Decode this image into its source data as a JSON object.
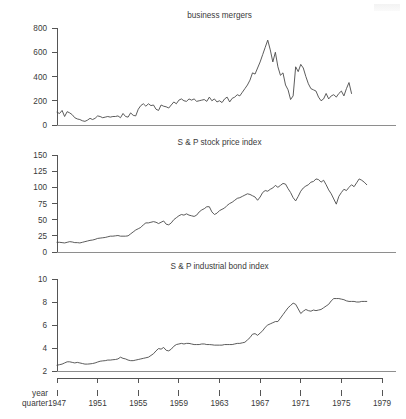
{
  "figure": {
    "width": 406,
    "height": 419,
    "background": "#ffffff",
    "line_color": "#4a4a4a",
    "axis_color": "#555555",
    "text_color": "#3a3a3a"
  },
  "axis_names": {
    "year": "year",
    "quarter": "quarter"
  },
  "x_axis": {
    "label_top": "year",
    "label_bottom": "quarter",
    "ticks": [
      1947,
      1951,
      1955,
      1959,
      1963,
      1967,
      1971,
      1975,
      1979
    ],
    "tick_labels": [
      "1947",
      "1951",
      "1955",
      "1959",
      "1963",
      "1967",
      "1971",
      "1975",
      "1979"
    ],
    "range": [
      1947,
      1979
    ]
  },
  "chart_data": [
    {
      "type": "line",
      "title": "business mergers",
      "xlabel": "year quarter",
      "ylabel": "",
      "xlim": [
        1947,
        1979
      ],
      "ylim": [
        0,
        800
      ],
      "yticks": [
        0,
        200,
        400,
        600,
        800
      ],
      "ytick_labels": [
        "0",
        "200",
        "400",
        "600",
        "800"
      ],
      "grid": false,
      "legend": "none",
      "x": [
        1947.0,
        1947.25,
        1947.5,
        1947.75,
        1948.0,
        1948.25,
        1948.5,
        1948.75,
        1949.0,
        1949.25,
        1949.5,
        1949.75,
        1950.0,
        1950.25,
        1950.5,
        1950.75,
        1951.0,
        1951.25,
        1951.5,
        1951.75,
        1952.0,
        1952.25,
        1952.5,
        1952.75,
        1953.0,
        1953.25,
        1953.5,
        1953.75,
        1954.0,
        1954.25,
        1954.5,
        1954.75,
        1955.0,
        1955.25,
        1955.5,
        1955.75,
        1956.0,
        1956.25,
        1956.5,
        1956.75,
        1957.0,
        1957.25,
        1957.5,
        1957.75,
        1958.0,
        1958.25,
        1958.5,
        1958.75,
        1959.0,
        1959.25,
        1959.5,
        1959.75,
        1960.0,
        1960.25,
        1960.5,
        1960.75,
        1961.0,
        1961.25,
        1961.5,
        1961.75,
        1962.0,
        1962.25,
        1962.5,
        1962.75,
        1963.0,
        1963.25,
        1963.5,
        1963.75,
        1964.0,
        1964.25,
        1964.5,
        1964.75,
        1965.0,
        1965.25,
        1965.5,
        1965.75,
        1966.0,
        1966.25,
        1966.5,
        1966.75,
        1967.0,
        1967.25,
        1967.5,
        1967.75,
        1968.0,
        1968.25,
        1968.5,
        1968.75,
        1969.0,
        1969.25,
        1969.5,
        1969.75,
        1970.0,
        1970.25,
        1970.5,
        1970.75,
        1971.0,
        1971.25,
        1971.5,
        1971.75,
        1972.0,
        1972.25,
        1972.5,
        1972.75,
        1973.0,
        1973.25,
        1973.5,
        1973.75,
        1974.0,
        1974.25,
        1974.5,
        1974.75,
        1975.0,
        1975.25,
        1975.5,
        1975.75,
        1976.0,
        1976.25,
        1976.5,
        1976.75,
        1977.0,
        1977.25,
        1977.5
      ],
      "values": [
        105,
        95,
        120,
        70,
        110,
        100,
        85,
        60,
        50,
        45,
        35,
        30,
        40,
        55,
        45,
        55,
        75,
        70,
        60,
        65,
        70,
        65,
        70,
        70,
        75,
        60,
        95,
        70,
        65,
        100,
        80,
        75,
        130,
        160,
        175,
        155,
        175,
        160,
        165,
        130,
        120,
        165,
        155,
        150,
        140,
        165,
        190,
        175,
        205,
        215,
        200,
        195,
        215,
        205,
        215,
        195,
        200,
        205,
        210,
        195,
        230,
        200,
        215,
        190,
        200,
        185,
        215,
        230,
        190,
        220,
        230,
        250,
        240,
        270,
        300,
        330,
        370,
        430,
        420,
        470,
        520,
        580,
        640,
        700,
        620,
        520,
        600,
        480,
        410,
        430,
        330,
        290,
        210,
        240,
        480,
        440,
        500,
        470,
        400,
        340,
        300,
        290,
        280,
        230,
        200,
        215,
        260,
        215,
        240,
        250,
        230,
        260,
        280,
        240,
        300,
        350,
        260
      ]
    },
    {
      "type": "line",
      "title": "S & P stock price index",
      "xlabel": "year quarter",
      "ylabel": "",
      "xlim": [
        1947,
        1979
      ],
      "ylim": [
        0,
        150
      ],
      "yticks": [
        0,
        25,
        50,
        75,
        100,
        125,
        150
      ],
      "ytick_labels": [
        "0",
        "25",
        "50",
        "75",
        "100",
        "125",
        "150"
      ],
      "grid": false,
      "legend": "none",
      "x": [
        1947.0,
        1947.25,
        1947.5,
        1947.75,
        1948.0,
        1948.25,
        1948.5,
        1948.75,
        1949.0,
        1949.25,
        1949.5,
        1949.75,
        1950.0,
        1950.25,
        1950.5,
        1950.75,
        1951.0,
        1951.25,
        1951.5,
        1951.75,
        1952.0,
        1952.25,
        1952.5,
        1952.75,
        1953.0,
        1953.25,
        1953.5,
        1953.75,
        1954.0,
        1954.25,
        1954.5,
        1954.75,
        1955.0,
        1955.25,
        1955.5,
        1955.75,
        1956.0,
        1956.25,
        1956.5,
        1956.75,
        1957.0,
        1957.25,
        1957.5,
        1957.75,
        1958.0,
        1958.25,
        1958.5,
        1958.75,
        1959.0,
        1959.25,
        1959.5,
        1959.75,
        1960.0,
        1960.25,
        1960.5,
        1960.75,
        1961.0,
        1961.25,
        1961.5,
        1961.75,
        1962.0,
        1962.25,
        1962.5,
        1962.75,
        1963.0,
        1963.25,
        1963.5,
        1963.75,
        1964.0,
        1964.25,
        1964.5,
        1964.75,
        1965.0,
        1965.25,
        1965.5,
        1965.75,
        1966.0,
        1966.25,
        1966.5,
        1966.75,
        1967.0,
        1967.25,
        1967.5,
        1967.75,
        1968.0,
        1968.25,
        1968.5,
        1968.75,
        1969.0,
        1969.25,
        1969.5,
        1969.75,
        1970.0,
        1970.25,
        1970.5,
        1970.75,
        1971.0,
        1971.25,
        1971.5,
        1971.75,
        1972.0,
        1972.25,
        1972.5,
        1972.75,
        1973.0,
        1973.25,
        1973.5,
        1973.75,
        1974.0,
        1974.25,
        1974.5,
        1974.75,
        1975.0,
        1975.25,
        1975.5,
        1975.75,
        1976.0,
        1976.25,
        1976.5,
        1976.75,
        1977.0,
        1977.25,
        1977.5
      ],
      "values": [
        15,
        15,
        14.5,
        14,
        15,
        16,
        15.5,
        14.5,
        14.5,
        14,
        15,
        16,
        17,
        18,
        18.5,
        19.5,
        21,
        21.5,
        22,
        22.5,
        23.5,
        24.5,
        24.5,
        25,
        25.5,
        24.5,
        24.5,
        24.5,
        25,
        28,
        31,
        34,
        36,
        38,
        42,
        45,
        45,
        46,
        47,
        46,
        44,
        46,
        48,
        43,
        42,
        45,
        50,
        53,
        56,
        58,
        57,
        59,
        57,
        56,
        55,
        57,
        62,
        65,
        67,
        70,
        70,
        62,
        58,
        60,
        64,
        66,
        68,
        72,
        75,
        77,
        80,
        83,
        84,
        86,
        88,
        90,
        89,
        87,
        85,
        80,
        85,
        92,
        95,
        94,
        97,
        99,
        103,
        100,
        103,
        106,
        105,
        98,
        92,
        84,
        79,
        86,
        94,
        99,
        102,
        104,
        108,
        109,
        113,
        112,
        108,
        111,
        104,
        96,
        90,
        82,
        74,
        86,
        92,
        97,
        95,
        100,
        104,
        101,
        107,
        113,
        111,
        108,
        104
      ]
    },
    {
      "type": "line",
      "title": "S & P industrial bond index",
      "xlabel": "year quarter",
      "ylabel": "",
      "xlim": [
        1947,
        1979
      ],
      "ylim": [
        2,
        10
      ],
      "yticks": [
        2,
        4,
        6,
        8,
        10
      ],
      "ytick_labels": [
        "2",
        "4",
        "6",
        "8",
        "10"
      ],
      "grid": false,
      "legend": "none",
      "x": [
        1947.0,
        1947.25,
        1947.5,
        1947.75,
        1948.0,
        1948.25,
        1948.5,
        1948.75,
        1949.0,
        1949.25,
        1949.5,
        1949.75,
        1950.0,
        1950.25,
        1950.5,
        1950.75,
        1951.0,
        1951.25,
        1951.5,
        1951.75,
        1952.0,
        1952.25,
        1952.5,
        1952.75,
        1953.0,
        1953.25,
        1953.5,
        1953.75,
        1954.0,
        1954.25,
        1954.5,
        1954.75,
        1955.0,
        1955.25,
        1955.5,
        1955.75,
        1956.0,
        1956.25,
        1956.5,
        1956.75,
        1957.0,
        1957.25,
        1957.5,
        1957.75,
        1958.0,
        1958.25,
        1958.5,
        1958.75,
        1959.0,
        1959.25,
        1959.5,
        1959.75,
        1960.0,
        1960.25,
        1960.5,
        1960.75,
        1961.0,
        1961.25,
        1961.5,
        1961.75,
        1962.0,
        1962.25,
        1962.5,
        1962.75,
        1963.0,
        1963.25,
        1963.5,
        1963.75,
        1964.0,
        1964.25,
        1964.5,
        1964.75,
        1965.0,
        1965.25,
        1965.5,
        1965.75,
        1966.0,
        1966.25,
        1966.5,
        1966.75,
        1967.0,
        1967.25,
        1967.5,
        1967.75,
        1968.0,
        1968.25,
        1968.5,
        1968.75,
        1969.0,
        1969.25,
        1969.5,
        1969.75,
        1970.0,
        1970.25,
        1970.5,
        1970.75,
        1971.0,
        1971.25,
        1971.5,
        1971.75,
        1972.0,
        1972.25,
        1972.5,
        1972.75,
        1973.0,
        1973.25,
        1973.5,
        1973.75,
        1974.0,
        1974.25,
        1974.5,
        1974.75,
        1975.0,
        1975.25,
        1975.5,
        1975.75,
        1976.0,
        1976.25,
        1976.5,
        1976.75,
        1977.0,
        1977.25,
        1977.5
      ],
      "values": [
        2.5,
        2.55,
        2.6,
        2.7,
        2.8,
        2.8,
        2.75,
        2.7,
        2.75,
        2.7,
        2.65,
        2.6,
        2.6,
        2.62,
        2.65,
        2.7,
        2.78,
        2.85,
        2.88,
        2.9,
        2.95,
        2.95,
        2.98,
        3.0,
        3.05,
        3.2,
        3.1,
        3.05,
        2.95,
        2.9,
        2.9,
        2.95,
        3.0,
        3.05,
        3.1,
        3.15,
        3.2,
        3.35,
        3.5,
        3.75,
        3.95,
        3.9,
        4.05,
        3.8,
        3.75,
        3.9,
        4.15,
        4.3,
        4.35,
        4.4,
        4.35,
        4.4,
        4.4,
        4.35,
        4.3,
        4.3,
        4.3,
        4.35,
        4.35,
        4.3,
        4.3,
        4.28,
        4.25,
        4.25,
        4.25,
        4.25,
        4.3,
        4.3,
        4.3,
        4.3,
        4.35,
        4.4,
        4.4,
        4.45,
        4.5,
        4.7,
        4.9,
        5.2,
        5.25,
        5.1,
        5.3,
        5.5,
        5.8,
        6.0,
        6.1,
        6.2,
        6.3,
        6.3,
        6.6,
        6.9,
        7.2,
        7.5,
        7.7,
        7.9,
        7.8,
        7.4,
        7.0,
        7.2,
        7.35,
        7.25,
        7.2,
        7.3,
        7.25,
        7.3,
        7.35,
        7.5,
        7.65,
        7.8,
        8.1,
        8.3,
        8.3,
        8.3,
        8.25,
        8.2,
        8.1,
        8.05,
        8.05,
        8.05,
        8.0,
        8.0,
        8.05,
        8.05,
        8.05
      ]
    }
  ]
}
